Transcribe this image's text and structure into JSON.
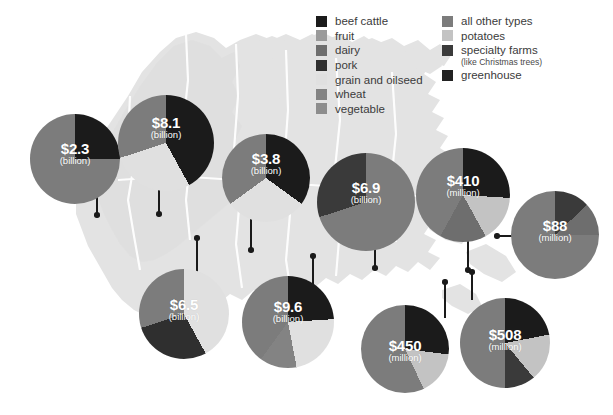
{
  "colors": {
    "background": "#ffffff",
    "map_land": "#e3e3e3",
    "map_land_alt": "#dcdcdc",
    "map_border": "#ffffff",
    "beef_cattle": "#1b1b1b",
    "fruit": "#9a9a9a",
    "dairy": "#6e6e6e",
    "pork": "#2f2f2f",
    "grain_and_oilseed": "#e0e0e0",
    "wheat": "#838383",
    "vegetable": "#8d8d8d",
    "all_other_types": "#7c7c7c",
    "potatoes": "#c3c3c3",
    "specialty_farms": "#3a3a3a",
    "greenhouse": "#222222",
    "leader_line": "#1a1a1a",
    "label_text": "#ffffff",
    "legend_text": "#3b3b3b"
  },
  "legend": {
    "left_column": [
      {
        "label": "beef cattle",
        "color": "#1b1b1b",
        "key": "beef_cattle"
      },
      {
        "label": "fruit",
        "color": "#9a9a9a",
        "key": "fruit"
      },
      {
        "label": "dairy",
        "color": "#6e6e6e",
        "key": "dairy"
      },
      {
        "label": "pork",
        "color": "#2f2f2f",
        "key": "pork"
      },
      {
        "label": "grain and oilseed",
        "color": "#e0e0e0",
        "key": "grain_and_oilseed"
      },
      {
        "label": "wheat",
        "color": "#838383",
        "key": "wheat"
      },
      {
        "label": "vegetable",
        "color": "#8d8d8d",
        "key": "vegetable"
      }
    ],
    "right_column": [
      {
        "label": "all other types",
        "color": "#7c7c7c",
        "key": "all_other_types",
        "sub": ""
      },
      {
        "label": "potatoes",
        "color": "#c3c3c3",
        "key": "potatoes",
        "sub": ""
      },
      {
        "label": "specialty farms",
        "color": "#3a3a3a",
        "key": "specialty_farms",
        "sub": "(like Christmas trees)"
      },
      {
        "label": "greenhouse",
        "color": "#222222",
        "key": "greenhouse",
        "sub": ""
      }
    ]
  },
  "chart_data": {
    "type": "pie",
    "legend_position": "top-right",
    "unit_note": "values shown in billions or millions of dollars",
    "charts": [
      {
        "id": "british-columbia",
        "amount": "$2.3",
        "unit": "(billion)",
        "cx": 75,
        "cy": 159,
        "r": 45,
        "label_dy": -4,
        "leader": {
          "type": "v",
          "x": 96,
          "y_top": 193,
          "y_bottom": 215,
          "dot_at": "bottom"
        },
        "slices": [
          {
            "name": "beef cattle",
            "color": "#1b1b1b",
            "percent": 25
          },
          {
            "name": "all other types",
            "color": "#7c7c7c",
            "percent": 75
          }
        ]
      },
      {
        "id": "alberta",
        "amount": "$8.1",
        "unit": "(billion)",
        "cx": 166,
        "cy": 143,
        "r": 48,
        "label_dy": -14,
        "leader": {
          "type": "v",
          "x": 158,
          "y_top": 186,
          "y_bottom": 214,
          "dot_at": "bottom"
        },
        "slices": [
          {
            "name": "beef cattle",
            "color": "#1b1b1b",
            "percent": 42
          },
          {
            "name": "grain and oilseed",
            "color": "#e0e0e0",
            "percent": 28
          },
          {
            "name": "all other types",
            "color": "#7c7c7c",
            "percent": 30
          }
        ]
      },
      {
        "id": "saskatchewan",
        "amount": "$3.8",
        "unit": "(billion)",
        "cx": 266,
        "cy": 178,
        "r": 44,
        "label_dy": -13,
        "leader": {
          "type": "v",
          "x": 250,
          "y_top": 216,
          "y_bottom": 250,
          "dot_at": "bottom"
        },
        "slices": [
          {
            "name": "beef cattle",
            "color": "#1b1b1b",
            "percent": 35
          },
          {
            "name": "grain and oilseed",
            "color": "#e0e0e0",
            "percent": 30
          },
          {
            "name": "all other types",
            "color": "#7c7c7c",
            "percent": 35
          }
        ]
      },
      {
        "id": "ontario",
        "amount": "$6.9",
        "unit": "(billion)",
        "cx": 366,
        "cy": 202,
        "r": 49,
        "label_dy": -8,
        "leader": {
          "type": "v",
          "x": 374,
          "y_top": 240,
          "y_bottom": 268,
          "dot_at": "bottom"
        },
        "slices": [
          {
            "name": "all other types",
            "color": "#7c7c7c",
            "percent": 70
          },
          {
            "name": "specialty farms",
            "color": "#3a3a3a",
            "percent": 30
          }
        ]
      },
      {
        "id": "quebec",
        "amount": "$410",
        "unit": "(million)",
        "cx": 463,
        "cy": 195,
        "r": 47,
        "label_dy": -8,
        "leader": {
          "type": "v",
          "x": 467,
          "y_top": 234,
          "y_bottom": 270,
          "dot_at": "bottom"
        },
        "slices": [
          {
            "name": "beef cattle",
            "color": "#1b1b1b",
            "percent": 26
          },
          {
            "name": "potatoes",
            "color": "#c3c3c3",
            "percent": 16
          },
          {
            "name": "dairy",
            "color": "#6e6e6e",
            "percent": 16
          },
          {
            "name": "all other types",
            "color": "#7c7c7c",
            "percent": 42
          }
        ]
      },
      {
        "id": "newfoundland",
        "amount": "$88",
        "unit": "(million)",
        "cx": 555,
        "cy": 235,
        "r": 44,
        "label_dy": -3,
        "leader": {
          "type": "h",
          "x_left": 497,
          "x_right": 534,
          "y": 235,
          "dot_at": "left"
        },
        "slices": [
          {
            "name": "specialty farms",
            "color": "#3a3a3a",
            "percent": 13
          },
          {
            "name": "dairy",
            "color": "#6e6e6e",
            "percent": 12
          },
          {
            "name": "all other types",
            "color": "#7c7c7c",
            "percent": 75
          }
        ]
      },
      {
        "id": "manitoba",
        "amount": "$6.5",
        "unit": "(billion)",
        "cx": 184,
        "cy": 314,
        "r": 45,
        "label_dy": -3,
        "leader": {
          "type": "v",
          "x": 196,
          "y_top": 238,
          "y_bottom": 276,
          "dot_at": "top"
        },
        "slices": [
          {
            "name": "grain and oilseed",
            "color": "#e0e0e0",
            "percent": 42
          },
          {
            "name": "pork",
            "color": "#2f2f2f",
            "percent": 28
          },
          {
            "name": "all other types",
            "color": "#7c7c7c",
            "percent": 30
          }
        ]
      },
      {
        "id": "atlantic-central",
        "amount": "$9.6",
        "unit": "(billion)",
        "cx": 288,
        "cy": 322,
        "r": 46,
        "label_dy": -9,
        "leader": {
          "type": "v",
          "x": 312,
          "y_top": 256,
          "y_bottom": 288,
          "dot_at": "top"
        },
        "slices": [
          {
            "name": "beef cattle",
            "color": "#1b1b1b",
            "percent": 24
          },
          {
            "name": "grain and oilseed",
            "color": "#e0e0e0",
            "percent": 23
          },
          {
            "name": "wheat",
            "color": "#838383",
            "percent": 13
          },
          {
            "name": "all other types",
            "color": "#7c7c7c",
            "percent": 40
          }
        ]
      },
      {
        "id": "new-brunswick",
        "amount": "$450",
        "unit": "(million)",
        "cx": 405,
        "cy": 349,
        "r": 44,
        "label_dy": 3,
        "leader": {
          "type": "v",
          "x": 444,
          "y_top": 282,
          "y_bottom": 318,
          "dot_at": "top"
        },
        "slices": [
          {
            "name": "beef cattle",
            "color": "#1b1b1b",
            "percent": 27
          },
          {
            "name": "potatoes",
            "color": "#c3c3c3",
            "percent": 16
          },
          {
            "name": "all other types",
            "color": "#7c7c7c",
            "percent": 57
          }
        ]
      },
      {
        "id": "nova-scotia",
        "amount": "$508",
        "unit": "(million)",
        "cx": 505,
        "cy": 343,
        "r": 45,
        "label_dy": -2,
        "leader": {
          "type": "v",
          "x": 471,
          "y_top": 272,
          "y_bottom": 300,
          "dot_at": "top"
        },
        "slices": [
          {
            "name": "beef cattle",
            "color": "#1b1b1b",
            "percent": 22
          },
          {
            "name": "potatoes",
            "color": "#c3c3c3",
            "percent": 17
          },
          {
            "name": "specialty farms",
            "color": "#3a3a3a",
            "percent": 11
          },
          {
            "name": "all other types",
            "color": "#7c7c7c",
            "percent": 50
          }
        ]
      }
    ]
  }
}
